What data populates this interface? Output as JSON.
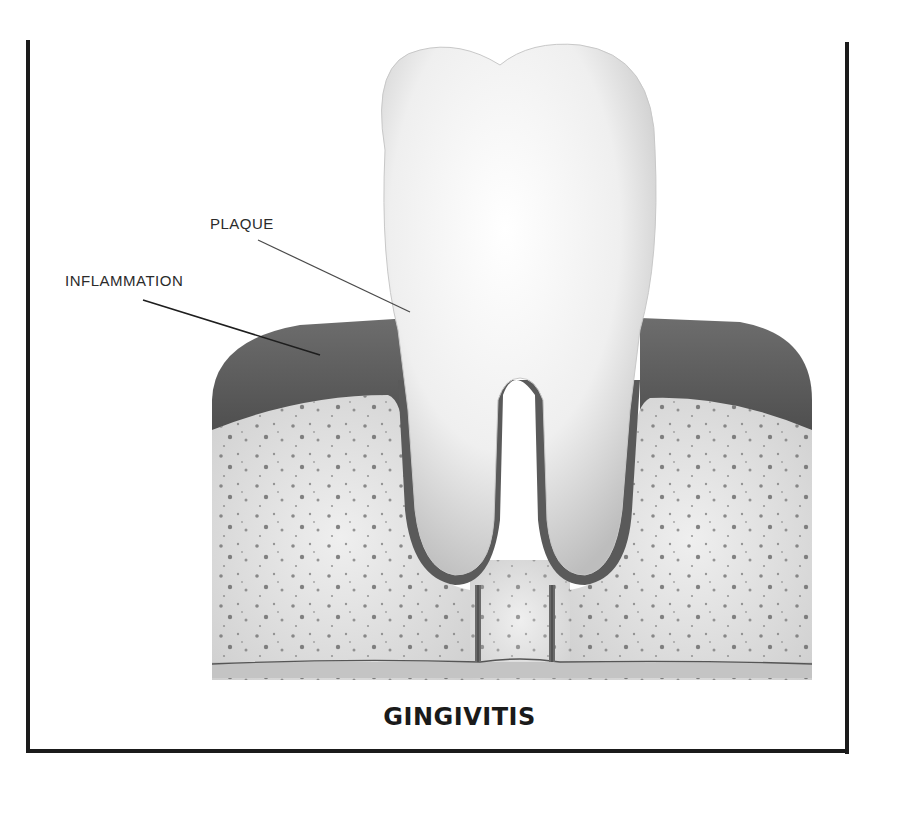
{
  "diagram": {
    "title": "GINGIVITIS",
    "labels": [
      {
        "id": "plaque",
        "text": "PLAQUE",
        "points_to": "tooth crown near gumline"
      },
      {
        "id": "inflammation",
        "text": "INFLAMMATION",
        "points_to": "swollen gum tissue"
      }
    ],
    "parts": [
      "tooth crown",
      "tooth roots",
      "gum tissue",
      "bone",
      "periodontal ligament"
    ],
    "colors": {
      "frame": "#1b1b1b",
      "tooth": "#f2f2f2",
      "gum": "#5e5e5e",
      "bone": "#d9d9d9",
      "text": "#2b2b2b"
    }
  }
}
